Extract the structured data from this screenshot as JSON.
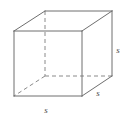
{
  "figure": {
    "shape_name": "cube",
    "projection": "oblique",
    "background_color": "#ffffff",
    "line_color": "#6e6e6e",
    "hidden_line_color": "#8a8a8a",
    "label_color": "#4a4a4a",
    "labels": [
      {
        "id": "right-height",
        "text": "s",
        "x": 118,
        "y": 50,
        "describes": "vertical-right-edge"
      },
      {
        "id": "bottom-width",
        "text": "s",
        "x": 46,
        "y": 110,
        "describes": "front-bottom-edge"
      },
      {
        "id": "depth",
        "text": "s",
        "x": 98,
        "y": 93,
        "describes": "bottom-right-depth-edge"
      }
    ],
    "vertices": {
      "front_top_left": {
        "x": 14,
        "y": 31
      },
      "front_top_right": {
        "x": 82,
        "y": 31
      },
      "front_bottom_right": {
        "x": 82,
        "y": 96
      },
      "front_bottom_left": {
        "x": 14,
        "y": 96
      },
      "back_top_left": {
        "x": 45,
        "y": 11
      },
      "back_top_right": {
        "x": 112,
        "y": 11
      },
      "back_bottom_right": {
        "x": 112,
        "y": 76
      },
      "back_bottom_left": {
        "x": 45,
        "y": 76
      }
    },
    "visible_edges": [
      {
        "name": "front-top",
        "from": "front_top_left",
        "to": "front_top_right"
      },
      {
        "name": "front-right",
        "from": "front_top_right",
        "to": "front_bottom_right"
      },
      {
        "name": "front-bottom",
        "from": "front_bottom_right",
        "to": "front_bottom_left"
      },
      {
        "name": "front-left",
        "from": "front_bottom_left",
        "to": "front_top_left"
      },
      {
        "name": "back-top",
        "from": "back_top_left",
        "to": "back_top_right"
      },
      {
        "name": "back-right",
        "from": "back_top_right",
        "to": "back_bottom_right"
      },
      {
        "name": "depth-top-left",
        "from": "front_top_left",
        "to": "back_top_left"
      },
      {
        "name": "depth-top-right",
        "from": "front_top_right",
        "to": "back_top_right"
      },
      {
        "name": "depth-bottom-right",
        "from": "front_bottom_right",
        "to": "back_bottom_right"
      }
    ],
    "hidden_edges": [
      {
        "name": "back-left-vertical",
        "from": "back_top_left",
        "to": "back_bottom_left"
      },
      {
        "name": "back-bottom",
        "from": "back_bottom_left",
        "to": "back_bottom_right"
      },
      {
        "name": "depth-bottom-left",
        "from": "back_bottom_left",
        "to": "front_bottom_left"
      }
    ]
  }
}
